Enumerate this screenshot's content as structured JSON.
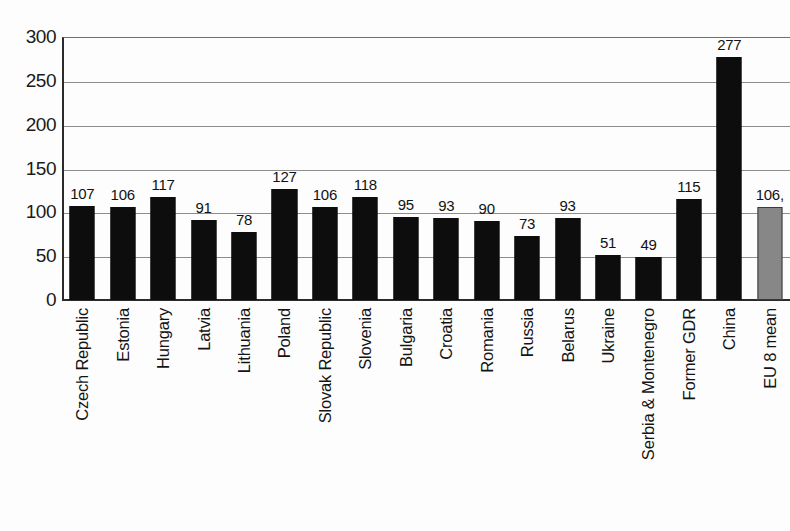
{
  "chart_data": {
    "type": "bar",
    "title": "",
    "subtitle": "",
    "xlabel": "",
    "ylabel": "",
    "ylim": [
      0,
      300
    ],
    "yticks": [
      0,
      50,
      100,
      150,
      200,
      250,
      300
    ],
    "grid": true,
    "legend": "none",
    "categories": [
      "Czech Republic",
      "Estonia",
      "Hungary",
      "Latvia",
      "Lithuania",
      "Poland",
      "Slovak Republic",
      "Slovenia",
      "Bulgaria",
      "Croatia",
      "Romania",
      "Russia",
      "Belarus",
      "Ukraine",
      "Serbia & Montenegro",
      "Former GDR",
      "China",
      "EU 8 mean"
    ],
    "values": [
      107,
      106,
      117,
      91,
      78,
      127,
      106,
      118,
      95,
      93,
      90,
      73,
      93,
      51,
      49,
      115,
      277,
      106
    ],
    "value_labels": [
      "107",
      "106",
      "117",
      "91",
      "78",
      "127",
      "106",
      "118",
      "95",
      "93",
      "90",
      "73",
      "93",
      "51",
      "49",
      "115",
      "277",
      "106,"
    ],
    "bar_colors": [
      "#0d0d0d",
      "#0d0d0d",
      "#0d0d0d",
      "#0d0d0d",
      "#0d0d0d",
      "#0d0d0d",
      "#0d0d0d",
      "#0d0d0d",
      "#0d0d0d",
      "#0d0d0d",
      "#0d0d0d",
      "#0d0d0d",
      "#0d0d0d",
      "#0d0d0d",
      "#0d0d0d",
      "#0d0d0d",
      "#0d0d0d",
      "#878787"
    ],
    "highlight_category": "EU 8 mean",
    "highlight_color": "#878787",
    "series_color": "#0d0d0d",
    "axis_color": "#2b2b2b",
    "grid_color": "#8d8d8d"
  }
}
